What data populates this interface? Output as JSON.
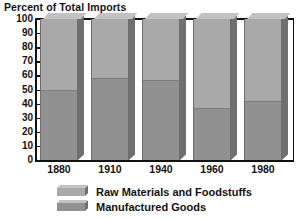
{
  "chart_data": {
    "type": "bar",
    "subtype": "stacked-column-3d",
    "title": "Percent of Total Imports",
    "xlabel": "",
    "ylabel": "",
    "categories": [
      "1880",
      "1910",
      "1940",
      "1960",
      "1980"
    ],
    "series": [
      {
        "name": "Raw Materials and Foodstuffs",
        "color": "#a9a9a9",
        "values": [
          50,
          42,
          43,
          63,
          58
        ]
      },
      {
        "name": "Manufactured Goods",
        "color": "#919191",
        "values": [
          50,
          58,
          57,
          37,
          42
        ]
      }
    ],
    "stack_boundaries_percent": [
      50,
      58,
      57,
      37,
      42
    ],
    "ylim": [
      0,
      100
    ],
    "yticks": [
      "100",
      "90",
      "80",
      "70",
      "60",
      "50",
      "40",
      "30",
      "20",
      "10",
      "0"
    ],
    "grid": false,
    "legend_position": "bottom-left",
    "legend": [
      {
        "label": "Raw Materials and Foodstuffs",
        "color": "#a9a9a9"
      },
      {
        "label": "Manufactured Goods",
        "color": "#919191"
      }
    ]
  },
  "colors": {
    "axis": "#111111",
    "background": "#ffffff",
    "upper_segment": "#a9a9a9",
    "lower_segment": "#919191",
    "top_face": "#c2c2c2",
    "side_face": "#6f6f6f"
  }
}
